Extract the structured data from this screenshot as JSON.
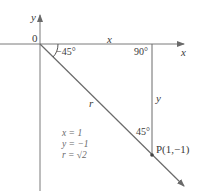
{
  "diagram": {
    "axes": {
      "x_label": "x",
      "y_label": "y",
      "origin_label": "0"
    },
    "segments": {
      "horizontal_label": "x",
      "vertical_label": "y",
      "hypotenuse_label": "r"
    },
    "angles": {
      "at_origin": "−45°",
      "right_angle": "90°",
      "at_point": "45°"
    },
    "point": {
      "label": "P(1,−1)"
    },
    "equations": [
      "x = 1",
      "y = −1",
      "r = √2"
    ]
  }
}
